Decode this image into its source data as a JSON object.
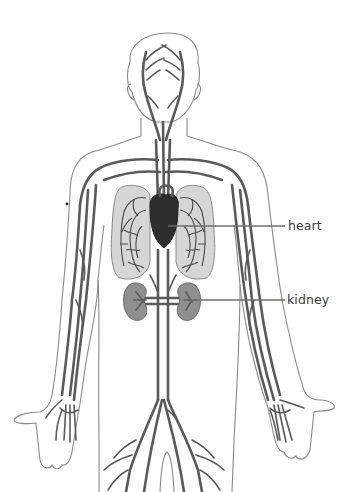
{
  "diagram": {
    "labels": [
      {
        "id": "heart",
        "text": "heart"
      },
      {
        "id": "kidney",
        "text": "kidney"
      }
    ],
    "colors": {
      "background": "#ffffff",
      "vessel": "#5a5a5a",
      "heart": "#2e2e2e",
      "lung_fill": "#d6d6d6",
      "kidney_fill": "#8f8f8f",
      "outline": "#8a8a8a",
      "label_text": "#3a3a3a"
    }
  }
}
